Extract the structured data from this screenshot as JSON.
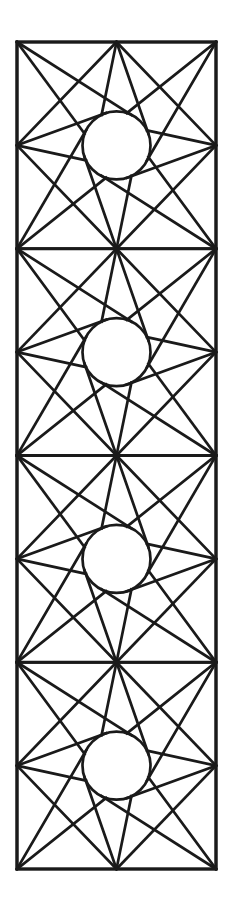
{
  "page": {
    "kind": "line-art-coloring-page",
    "width": 233,
    "height": 909,
    "background_color": "#ffffff",
    "line_color": "#1a1a1a"
  },
  "panel": {
    "name": "vertical-star-panel",
    "x": 17,
    "y": 42,
    "width": 199,
    "height": 827,
    "border_stroke_width": 3.2,
    "tile_count": 4,
    "tile_width": 199,
    "tile_height": 206.75,
    "divider_y_positions": [
      248.75,
      455.5,
      662.25
    ]
  },
  "tile": {
    "name": "eight-point-pinwheel-star-tile",
    "star_points": 8,
    "point_anchors": [
      "top-left-corner",
      "top-edge-midpoint",
      "top-right-corner",
      "right-edge-midpoint",
      "bottom-right-corner",
      "bottom-edge-midpoint",
      "bottom-left-corner",
      "left-edge-midpoint"
    ],
    "circle": {
      "name": "center-circle",
      "cx_fraction": 0.5,
      "cy_fraction": 0.5,
      "radius": 34,
      "stroke_width": 2.7
    },
    "pinwheel_rotation": "clockwise",
    "tangent_offset_degrees": 26,
    "line_stroke_width": 2.7
  },
  "tiles": [
    {
      "index": 1,
      "label": "star-tile-1"
    },
    {
      "index": 2,
      "label": "star-tile-2"
    },
    {
      "index": 3,
      "label": "star-tile-3"
    },
    {
      "index": 4,
      "label": "star-tile-4"
    }
  ]
}
